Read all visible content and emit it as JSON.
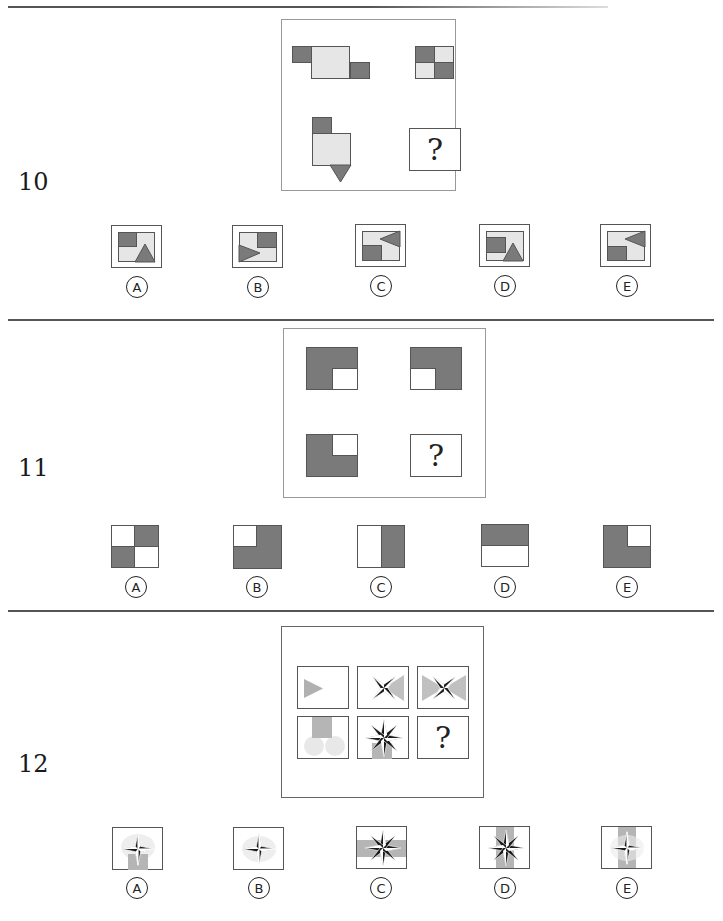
{
  "questions": [
    {
      "number": "10",
      "question_mark": "?",
      "options": [
        {
          "letter": "A"
        },
        {
          "letter": "B"
        },
        {
          "letter": "C"
        },
        {
          "letter": "D"
        },
        {
          "letter": "E"
        }
      ]
    },
    {
      "number": "11",
      "question_mark": "?",
      "options": [
        {
          "letter": "A"
        },
        {
          "letter": "B"
        },
        {
          "letter": "C"
        },
        {
          "letter": "D"
        },
        {
          "letter": "E"
        }
      ]
    },
    {
      "number": "12",
      "question_mark": "?",
      "options": [
        {
          "letter": "A"
        },
        {
          "letter": "B"
        },
        {
          "letter": "C"
        },
        {
          "letter": "D"
        },
        {
          "letter": "E"
        }
      ]
    }
  ],
  "colors": {
    "dark_fill": "#7a7a7a",
    "light_fill": "#e6e6e6",
    "accent_gray": "#b0b0b0",
    "rule": "#555555"
  }
}
